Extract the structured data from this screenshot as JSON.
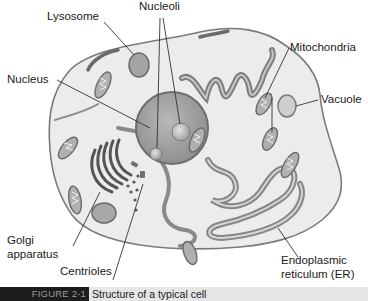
{
  "figure": {
    "title": "Structure of a typical cell",
    "tag": "FIGURE 2-1",
    "colors": {
      "cytoplasm": "#ececec",
      "membrane": "#7a7a7a",
      "nucleus": "#a8a8a8",
      "organelle": "#9a9a9a",
      "caption_tag_bg": "#1c1c1c",
      "caption_bar_bg": "#e6e6e6"
    }
  },
  "labels": {
    "lysosome": "Lysosome",
    "nucleoli": "Nucleoli",
    "mitochondria": "Mitochondria",
    "nucleus": "Nucleus",
    "vacuole": "Vacuole",
    "golgi_line1": "Golgi",
    "golgi_line2": "apparatus",
    "centrioles": "Centrioles",
    "er_line1": "Endoplasmic",
    "er_line2": "reticulum (ER)"
  }
}
